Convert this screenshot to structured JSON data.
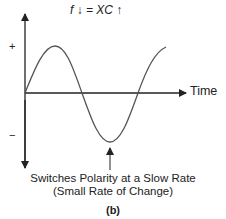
{
  "figure": {
    "formula": "f↓ = X_C↑",
    "formula_display": "f ↓ = XC ↑",
    "y_axis": {
      "positive_label": "+",
      "negative_label": "−"
    },
    "x_axis": {
      "label": "Time"
    },
    "annotation_line1": "Switches Polarity at a Slow Rate",
    "annotation_line2": "(Small Rate of Change)",
    "panel_label": "(b)",
    "curve": {
      "type": "sine",
      "cycles": 1.25,
      "color": "#555555"
    }
  }
}
